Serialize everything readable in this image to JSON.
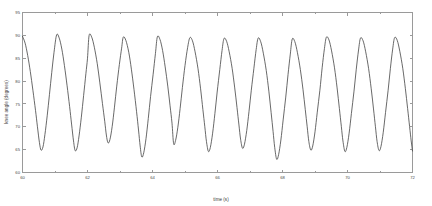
{
  "chart_data": {
    "type": "line",
    "title": "",
    "subtitle": "",
    "xlabel": "time (s)",
    "ylabel": "knee angle (degrees)",
    "xlim": [
      60,
      72
    ],
    "ylim": [
      60,
      95
    ],
    "grid": false,
    "legend": null,
    "legend_position": "none",
    "x_ticks": [
      60,
      62,
      64,
      66,
      68,
      70,
      72
    ],
    "x_tick_labels": [
      "60",
      "62",
      "64",
      "66",
      "68",
      "70",
      "72"
    ],
    "y_ticks": [
      60,
      65,
      70,
      75,
      80,
      85,
      90,
      95
    ],
    "y_tick_labels": [
      "60",
      "65",
      "70",
      "75",
      "80",
      "85",
      "90",
      "95"
    ],
    "x_minor_ticks": [
      61,
      63,
      65,
      67,
      69,
      71
    ],
    "series": [
      {
        "name": "knee angle",
        "color": "#434343",
        "line_width": 0.8,
        "marker": "none",
        "description": "Quasi-periodic oscillation of knee flexion angle during repeated cycling/gait cycles; approximately 11 full cycles across 12 seconds (about 0.93 Hz). Peaks are consistently near 90 degrees; troughs vary between about 63 and 68 degrees.",
        "peaks": [
          {
            "t": 60.0,
            "y": 89.8
          },
          {
            "t": 61.05,
            "y": 90.1
          },
          {
            "t": 62.05,
            "y": 90.0
          },
          {
            "t": 63.1,
            "y": 89.6
          },
          {
            "t": 64.15,
            "y": 89.7
          },
          {
            "t": 65.15,
            "y": 89.5
          },
          {
            "t": 66.2,
            "y": 89.3
          },
          {
            "t": 67.25,
            "y": 89.4
          },
          {
            "t": 68.3,
            "y": 89.2
          },
          {
            "t": 69.35,
            "y": 89.6
          },
          {
            "t": 70.35,
            "y": 89.4
          },
          {
            "t": 71.4,
            "y": 89.5
          }
        ],
        "troughs": [
          {
            "t": 60.55,
            "y": 64.9
          },
          {
            "t": 61.55,
            "y": 64.8
          },
          {
            "t": 62.6,
            "y": 66.5
          },
          {
            "t": 63.65,
            "y": 63.4
          },
          {
            "t": 64.65,
            "y": 66.3
          },
          {
            "t": 65.7,
            "y": 64.6
          },
          {
            "t": 66.75,
            "y": 65.3
          },
          {
            "t": 67.8,
            "y": 62.9
          },
          {
            "t": 68.8,
            "y": 64.9
          },
          {
            "t": 69.85,
            "y": 64.6
          },
          {
            "t": 70.9,
            "y": 64.8
          },
          {
            "t": 71.95,
            "y": 64.7
          }
        ],
        "points": [
          {
            "t": 60.0,
            "y": 89.8
          },
          {
            "t": 60.08,
            "y": 88.3
          },
          {
            "t": 60.16,
            "y": 85.6
          },
          {
            "t": 60.24,
            "y": 82.1
          },
          {
            "t": 60.32,
            "y": 78.0
          },
          {
            "t": 60.4,
            "y": 73.6
          },
          {
            "t": 60.46,
            "y": 70.0
          },
          {
            "t": 60.52,
            "y": 66.6
          },
          {
            "t": 60.57,
            "y": 64.9
          },
          {
            "t": 60.63,
            "y": 65.6
          },
          {
            "t": 60.69,
            "y": 68.3
          },
          {
            "t": 60.76,
            "y": 72.4
          },
          {
            "t": 60.83,
            "y": 77.1
          },
          {
            "t": 60.9,
            "y": 81.9
          },
          {
            "t": 60.97,
            "y": 86.3
          },
          {
            "t": 61.05,
            "y": 90.1
          },
          {
            "t": 61.13,
            "y": 89.4
          },
          {
            "t": 61.21,
            "y": 87.0
          },
          {
            "t": 61.29,
            "y": 83.4
          },
          {
            "t": 61.37,
            "y": 79.1
          },
          {
            "t": 61.45,
            "y": 74.4
          },
          {
            "t": 61.51,
            "y": 70.6
          },
          {
            "t": 61.57,
            "y": 66.9
          },
          {
            "t": 61.62,
            "y": 64.8
          },
          {
            "t": 61.68,
            "y": 65.4
          },
          {
            "t": 61.74,
            "y": 68.0
          },
          {
            "t": 61.81,
            "y": 72.1
          },
          {
            "t": 61.88,
            "y": 76.8
          },
          {
            "t": 61.95,
            "y": 81.6
          },
          {
            "t": 62.0,
            "y": 85.0
          },
          {
            "t": 62.05,
            "y": 90.0
          },
          {
            "t": 62.13,
            "y": 89.6
          },
          {
            "t": 62.21,
            "y": 87.4
          },
          {
            "t": 62.3,
            "y": 83.8
          },
          {
            "t": 62.38,
            "y": 79.6
          },
          {
            "t": 62.46,
            "y": 75.1
          },
          {
            "t": 62.53,
            "y": 71.2
          },
          {
            "t": 62.58,
            "y": 68.2
          },
          {
            "t": 62.63,
            "y": 66.5
          },
          {
            "t": 62.69,
            "y": 67.2
          },
          {
            "t": 62.76,
            "y": 70.1
          },
          {
            "t": 62.83,
            "y": 74.3
          },
          {
            "t": 62.9,
            "y": 78.9
          },
          {
            "t": 62.98,
            "y": 83.6
          },
          {
            "t": 63.05,
            "y": 87.2
          },
          {
            "t": 63.1,
            "y": 89.6
          },
          {
            "t": 63.18,
            "y": 88.9
          },
          {
            "t": 63.27,
            "y": 86.3
          },
          {
            "t": 63.35,
            "y": 82.6
          },
          {
            "t": 63.43,
            "y": 78.2
          },
          {
            "t": 63.51,
            "y": 73.3
          },
          {
            "t": 63.57,
            "y": 69.3
          },
          {
            "t": 63.62,
            "y": 65.8
          },
          {
            "t": 63.67,
            "y": 63.4
          },
          {
            "t": 63.73,
            "y": 64.3
          },
          {
            "t": 63.8,
            "y": 67.4
          },
          {
            "t": 63.87,
            "y": 71.8
          },
          {
            "t": 63.94,
            "y": 76.6
          },
          {
            "t": 64.02,
            "y": 81.5
          },
          {
            "t": 64.09,
            "y": 86.0
          },
          {
            "t": 64.15,
            "y": 89.7
          },
          {
            "t": 64.23,
            "y": 89.1
          },
          {
            "t": 64.31,
            "y": 86.7
          },
          {
            "t": 64.39,
            "y": 83.1
          },
          {
            "t": 64.47,
            "y": 78.9
          },
          {
            "t": 64.54,
            "y": 74.6
          },
          {
            "t": 64.6,
            "y": 70.8
          },
          {
            "t": 64.65,
            "y": 66.3
          },
          {
            "t": 64.71,
            "y": 67.0
          },
          {
            "t": 64.78,
            "y": 69.9
          },
          {
            "t": 64.85,
            "y": 74.0
          },
          {
            "t": 64.92,
            "y": 78.6
          },
          {
            "t": 65.0,
            "y": 83.4
          },
          {
            "t": 65.08,
            "y": 87.3
          },
          {
            "t": 65.15,
            "y": 89.5
          },
          {
            "t": 65.23,
            "y": 88.8
          },
          {
            "t": 65.31,
            "y": 86.4
          },
          {
            "t": 65.4,
            "y": 82.7
          },
          {
            "t": 65.48,
            "y": 78.3
          },
          {
            "t": 65.55,
            "y": 73.8
          },
          {
            "t": 65.61,
            "y": 70.0
          },
          {
            "t": 65.66,
            "y": 66.8
          },
          {
            "t": 65.72,
            "y": 64.6
          },
          {
            "t": 65.78,
            "y": 65.5
          },
          {
            "t": 65.85,
            "y": 68.6
          },
          {
            "t": 65.92,
            "y": 72.9
          },
          {
            "t": 65.99,
            "y": 77.6
          },
          {
            "t": 66.07,
            "y": 82.5
          },
          {
            "t": 66.14,
            "y": 86.7
          },
          {
            "t": 66.2,
            "y": 89.3
          },
          {
            "t": 66.28,
            "y": 88.7
          },
          {
            "t": 66.36,
            "y": 86.4
          },
          {
            "t": 66.45,
            "y": 82.8
          },
          {
            "t": 66.53,
            "y": 78.5
          },
          {
            "t": 66.6,
            "y": 74.2
          },
          {
            "t": 66.66,
            "y": 70.4
          },
          {
            "t": 66.71,
            "y": 67.3
          },
          {
            "t": 66.77,
            "y": 65.3
          },
          {
            "t": 66.83,
            "y": 66.2
          },
          {
            "t": 66.9,
            "y": 69.2
          },
          {
            "t": 66.97,
            "y": 73.4
          },
          {
            "t": 67.04,
            "y": 78.0
          },
          {
            "t": 67.12,
            "y": 82.8
          },
          {
            "t": 67.19,
            "y": 86.9
          },
          {
            "t": 67.25,
            "y": 89.4
          },
          {
            "t": 67.33,
            "y": 88.6
          },
          {
            "t": 67.41,
            "y": 86.1
          },
          {
            "t": 67.5,
            "y": 82.3
          },
          {
            "t": 67.58,
            "y": 77.8
          },
          {
            "t": 67.65,
            "y": 73.1
          },
          {
            "t": 67.71,
            "y": 69.0
          },
          {
            "t": 67.76,
            "y": 65.5
          },
          {
            "t": 67.82,
            "y": 62.9
          },
          {
            "t": 67.88,
            "y": 63.9
          },
          {
            "t": 67.95,
            "y": 67.1
          },
          {
            "t": 68.02,
            "y": 71.5
          },
          {
            "t": 68.1,
            "y": 76.5
          },
          {
            "t": 68.17,
            "y": 81.4
          },
          {
            "t": 68.24,
            "y": 85.9
          },
          {
            "t": 68.3,
            "y": 89.2
          },
          {
            "t": 68.38,
            "y": 88.6
          },
          {
            "t": 68.46,
            "y": 86.2
          },
          {
            "t": 68.55,
            "y": 82.5
          },
          {
            "t": 68.63,
            "y": 78.2
          },
          {
            "t": 68.7,
            "y": 73.8
          },
          {
            "t": 68.76,
            "y": 70.0
          },
          {
            "t": 68.81,
            "y": 66.8
          },
          {
            "t": 68.87,
            "y": 64.9
          },
          {
            "t": 68.93,
            "y": 65.8
          },
          {
            "t": 69.0,
            "y": 68.9
          },
          {
            "t": 69.07,
            "y": 73.2
          },
          {
            "t": 69.15,
            "y": 78.0
          },
          {
            "t": 69.22,
            "y": 82.9
          },
          {
            "t": 69.29,
            "y": 87.1
          },
          {
            "t": 69.35,
            "y": 89.6
          },
          {
            "t": 69.43,
            "y": 89.0
          },
          {
            "t": 69.51,
            "y": 86.6
          },
          {
            "t": 69.6,
            "y": 82.9
          },
          {
            "t": 69.68,
            "y": 78.5
          },
          {
            "t": 69.75,
            "y": 74.0
          },
          {
            "t": 69.81,
            "y": 70.1
          },
          {
            "t": 69.86,
            "y": 66.9
          },
          {
            "t": 69.92,
            "y": 64.6
          },
          {
            "t": 69.98,
            "y": 65.5
          },
          {
            "t": 70.05,
            "y": 68.6
          },
          {
            "t": 70.12,
            "y": 72.9
          },
          {
            "t": 70.2,
            "y": 77.8
          },
          {
            "t": 70.27,
            "y": 82.6
          },
          {
            "t": 70.34,
            "y": 86.8
          },
          {
            "t": 70.4,
            "y": 89.4
          },
          {
            "t": 70.48,
            "y": 88.8
          },
          {
            "t": 70.56,
            "y": 86.4
          },
          {
            "t": 70.65,
            "y": 82.7
          },
          {
            "t": 70.73,
            "y": 78.3
          },
          {
            "t": 70.8,
            "y": 73.9
          },
          {
            "t": 70.86,
            "y": 70.0
          },
          {
            "t": 70.91,
            "y": 66.8
          },
          {
            "t": 70.97,
            "y": 64.8
          },
          {
            "t": 71.03,
            "y": 65.7
          },
          {
            "t": 71.1,
            "y": 68.8
          },
          {
            "t": 71.17,
            "y": 73.1
          },
          {
            "t": 71.25,
            "y": 78.0
          },
          {
            "t": 71.32,
            "y": 82.8
          },
          {
            "t": 71.39,
            "y": 87.0
          },
          {
            "t": 71.45,
            "y": 89.5
          },
          {
            "t": 71.53,
            "y": 88.9
          },
          {
            "t": 71.61,
            "y": 86.5
          },
          {
            "t": 71.7,
            "y": 82.8
          },
          {
            "t": 71.78,
            "y": 78.4
          },
          {
            "t": 71.85,
            "y": 74.0
          },
          {
            "t": 71.91,
            "y": 70.1
          },
          {
            "t": 71.96,
            "y": 66.9
          },
          {
            "t": 72.0,
            "y": 64.7
          }
        ]
      }
    ]
  }
}
